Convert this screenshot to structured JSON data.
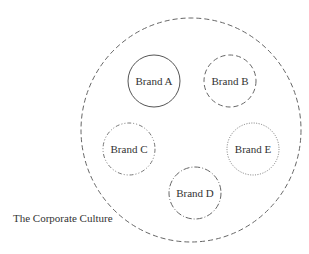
{
  "diagram": {
    "container": {
      "label": "The Corporate Culture",
      "cx": 191,
      "cy": 130,
      "rx": 110,
      "ry": 112,
      "stroke": "#666666",
      "style": "dashed"
    },
    "brands": [
      {
        "label": "Brand A",
        "cx": 154,
        "cy": 81,
        "r": 26,
        "style": "solid"
      },
      {
        "label": "Brand B",
        "cx": 230,
        "cy": 81,
        "r": 26,
        "style": "dashed"
      },
      {
        "label": "Brand C",
        "cx": 129,
        "cy": 149,
        "r": 26,
        "style": "dash-dot-dot"
      },
      {
        "label": "Brand D",
        "cx": 195,
        "cy": 193,
        "r": 26,
        "style": "dash-dot"
      },
      {
        "label": "Brand E",
        "cx": 253,
        "cy": 149,
        "r": 26,
        "style": "dotted"
      }
    ]
  }
}
